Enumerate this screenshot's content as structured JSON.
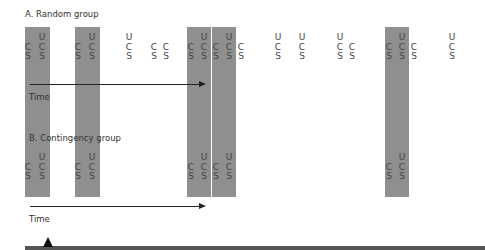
{
  "panels": [
    {
      "id": "A",
      "title": "A. Random group",
      "time_label": "Time",
      "columns": [
        {
          "x": 28,
          "labels": [
            "",
            "C",
            "S"
          ]
        },
        {
          "x": 42,
          "labels": [
            "U",
            "C",
            "S"
          ]
        },
        {
          "x": 78,
          "labels": [
            "",
            "C",
            "S"
          ]
        },
        {
          "x": 92,
          "labels": [
            "U",
            "C",
            "S"
          ]
        },
        {
          "x": 129,
          "labels": [
            "U",
            "C",
            "S"
          ]
        },
        {
          "x": 154,
          "labels": [
            "",
            "C",
            "S"
          ]
        },
        {
          "x": 166,
          "labels": [
            "",
            "C",
            "S"
          ]
        },
        {
          "x": 191,
          "labels": [
            "",
            "C",
            "S"
          ]
        },
        {
          "x": 204,
          "labels": [
            "U",
            "C",
            "S"
          ]
        },
        {
          "x": 216,
          "labels": [
            "",
            "C",
            "S"
          ]
        },
        {
          "x": 229,
          "labels": [
            "U",
            "C",
            "S"
          ]
        },
        {
          "x": 241,
          "labels": [
            "",
            "C",
            "S"
          ]
        },
        {
          "x": 278,
          "labels": [
            "U",
            "C",
            "S"
          ]
        },
        {
          "x": 302,
          "labels": [
            "U",
            "C",
            "S"
          ]
        },
        {
          "x": 340,
          "labels": [
            "U",
            "C",
            "S"
          ]
        },
        {
          "x": 352,
          "labels": [
            "",
            "C",
            "S"
          ]
        },
        {
          "x": 389,
          "labels": [
            "",
            "C",
            "S"
          ]
        },
        {
          "x": 402,
          "labels": [
            "U",
            "C",
            "S"
          ]
        },
        {
          "x": 414,
          "labels": [
            "",
            "C",
            "S"
          ]
        },
        {
          "x": 452,
          "labels": [
            "U",
            "C",
            "S"
          ]
        }
      ]
    },
    {
      "id": "B",
      "title": "B. Contingency group",
      "time_label": "Time",
      "columns": [
        {
          "x": 28,
          "labels": [
            "",
            "C",
            "S"
          ]
        },
        {
          "x": 42,
          "labels": [
            "U",
            "C",
            "S"
          ]
        },
        {
          "x": 78,
          "labels": [
            "",
            "C",
            "S"
          ]
        },
        {
          "x": 92,
          "labels": [
            "U",
            "C",
            "S"
          ]
        },
        {
          "x": 191,
          "labels": [
            "",
            "C",
            "S"
          ]
        },
        {
          "x": 204,
          "labels": [
            "U",
            "C",
            "S"
          ]
        },
        {
          "x": 216,
          "labels": [
            "",
            "C",
            "S"
          ]
        },
        {
          "x": 229,
          "labels": [
            "U",
            "C",
            "S"
          ]
        },
        {
          "x": 389,
          "labels": [
            "",
            "C",
            "S"
          ]
        },
        {
          "x": 402,
          "labels": [
            "U",
            "C",
            "S"
          ]
        }
      ]
    }
  ],
  "bands": [
    {
      "x": 25,
      "w": 25
    },
    {
      "x": 75,
      "w": 25
    },
    {
      "x": 187,
      "w": 24
    },
    {
      "x": 212,
      "w": 24
    },
    {
      "x": 385,
      "w": 24
    }
  ],
  "colors": {
    "band": "#8f8f8f",
    "text": "#333333",
    "arrow": "#222222"
  }
}
